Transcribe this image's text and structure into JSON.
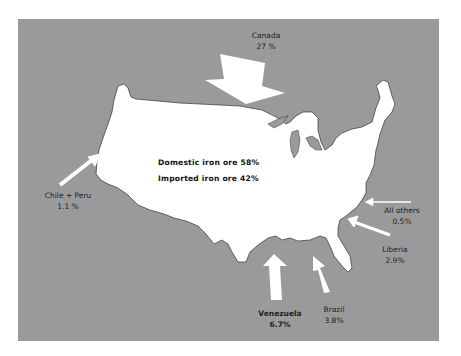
{
  "map": {
    "subject": "Sources of iron ore for the United States",
    "colors": {
      "background": "#9a9a9a",
      "land": "#ffffff",
      "arrows": "#ffffff",
      "text": "#1e1e1e"
    },
    "summary": {
      "domestic": "Domestic iron ore 58%",
      "imported": "Imported iron ore 42%"
    },
    "sources": [
      {
        "name": "Canada",
        "value": "27 %"
      },
      {
        "name": "Chile + Peru",
        "value": "1.1 %"
      },
      {
        "name": "All others",
        "value": "0.5%"
      },
      {
        "name": "Liberia",
        "value": "2.9%"
      },
      {
        "name": "Venezuela",
        "value": "6.7%"
      },
      {
        "name": "Brazil",
        "value": "3.8%"
      }
    ]
  }
}
